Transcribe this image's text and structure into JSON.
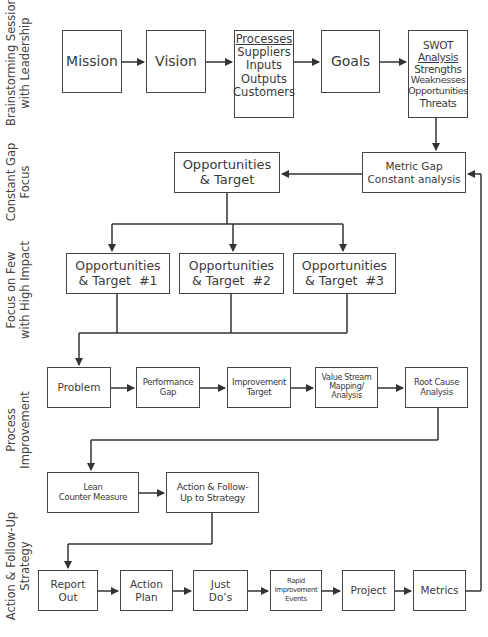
{
  "lanes": [
    {
      "id": "brainstorming",
      "label_1": "Brainstorming Session",
      "label_2": "with Leadership"
    },
    {
      "id": "constant-gap",
      "label_1": "Constant Gap",
      "label_2": "Focus"
    },
    {
      "id": "focus-few",
      "label_1": "Focus on Few",
      "label_2": "with High Impact"
    },
    {
      "id": "process-improvement",
      "label_1": "Process",
      "label_2": "Improvement"
    },
    {
      "id": "action-followup",
      "label_1": "Action & Follow-Up",
      "label_2": "Strategy"
    }
  ],
  "boxes": {
    "mission": {
      "line1": "Mission"
    },
    "vision": {
      "line1": "Vision"
    },
    "processes": {
      "title": "Processes",
      "line1": "Suppliers",
      "line2": "Inputs",
      "line3": "Outputs",
      "line4": "Customers"
    },
    "goals": {
      "line1": "Goals"
    },
    "swot": {
      "line1": "SWOT",
      "title": "Analysis",
      "line2": "Strengths",
      "line3": "Weaknesses",
      "line4": "Opportunities",
      "line5": "Threats"
    },
    "metric_gap": {
      "line1": "Metric Gap",
      "line2": "Constant analysis"
    },
    "opp_target": {
      "line1": "Opportunities",
      "line2": "& Target"
    },
    "opp_target_1": {
      "line1": "Opportunities",
      "line2": "& Target  #1"
    },
    "opp_target_2": {
      "line1": "Opportunities",
      "line2": "& Target  #2"
    },
    "opp_target_3": {
      "line1": "Opportunities",
      "line2": "& Target  #3"
    },
    "problem": {
      "line1": "Problem"
    },
    "performance_gap": {
      "line1": "Performance",
      "line2": "Gap"
    },
    "improvement_target": {
      "line1": "Improvement",
      "line2": "Target"
    },
    "value_stream": {
      "line1": "Value Stream",
      "line2": "Mapping/",
      "line3": "Analysis"
    },
    "root_cause": {
      "line1": "Root Cause",
      "line2": "Analysis"
    },
    "lean_counter": {
      "line1": "Lean",
      "line2": "Counter Measure"
    },
    "action_followup": {
      "line1": "Action & Follow-",
      "line2": "Up to Strategy"
    },
    "report_out": {
      "line1": "Report",
      "line2": "Out"
    },
    "action_plan": {
      "line1": "Action",
      "line2": "Plan"
    },
    "just_dos": {
      "line1": "Just",
      "line2": "Do’s"
    },
    "rapid_improvement": {
      "line1": "Rapid",
      "line2": "Improvement",
      "line3": "Events"
    },
    "project": {
      "line1": "Project"
    },
    "metrics": {
      "line1": "Metrics"
    }
  },
  "colors": {
    "line": "#333333",
    "border": "#444444",
    "text": "#3a3a3a",
    "background": "#ffffff"
  }
}
